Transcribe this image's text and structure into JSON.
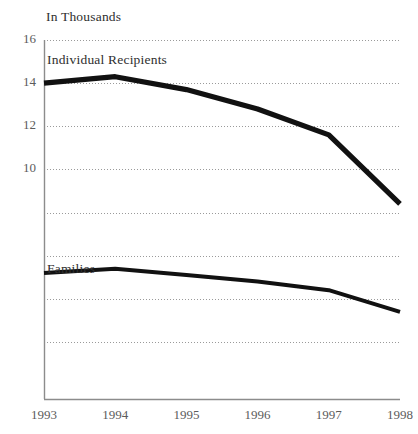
{
  "chart_data": {
    "type": "line",
    "title": "In Thousands",
    "xlabel": "",
    "ylabel": "In Thousands",
    "grid": true,
    "legend_position": "inline-labels",
    "x": [
      "1993",
      "1994",
      "1995",
      "1996",
      "1997",
      "1998"
    ],
    "xlim": [
      1993,
      1998
    ],
    "ylim": [
      0,
      16
    ],
    "yticks": [
      "16",
      "14",
      "12",
      "10"
    ],
    "ytick_values": [
      16,
      14,
      12,
      10
    ],
    "gridline_values": [
      16,
      14,
      12,
      10,
      8,
      6,
      4,
      2
    ],
    "series": [
      {
        "name": "Individual Recipients",
        "values": [
          14.0,
          14.3,
          13.7,
          12.8,
          11.6,
          8.4
        ],
        "color": "#111111"
      },
      {
        "name": "Families",
        "values": [
          5.2,
          5.4,
          5.1,
          4.8,
          4.4,
          3.4
        ],
        "color": "#111111"
      }
    ],
    "annotations": [
      {
        "text": "In Thousands",
        "x": 1993,
        "y": 16.8
      },
      {
        "text": "Individual Recipients",
        "x": 1993,
        "y": 15.0
      },
      {
        "text": "Families",
        "x": 1993,
        "y": 6.3
      }
    ]
  },
  "axis": {
    "y_labels": [
      "16",
      "14",
      "12",
      "10"
    ],
    "x_labels": [
      "1993",
      "1994",
      "1995",
      "1996",
      "1997",
      "1998"
    ],
    "caption": "In Thousands"
  },
  "labels": {
    "individual_recipients": "Individual Recipients",
    "families": "Families"
  },
  "colors": {
    "line": "#111111",
    "grid": "#9a9a9a",
    "axis": "#8c8c8c",
    "text": "#3a3a3a",
    "background": "#ffffff"
  }
}
